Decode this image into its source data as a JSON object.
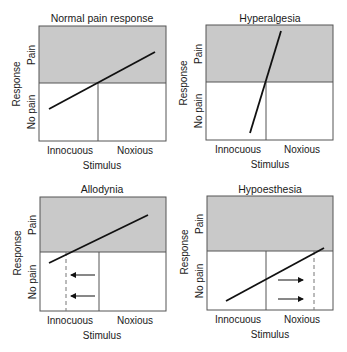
{
  "colors": {
    "pain_region": "#c9c9c9",
    "frame": "#555555",
    "curve": "#111111",
    "background": "#ffffff"
  },
  "axis": {
    "y_title": "Response",
    "y_pain": "Pain",
    "y_no_pain": "No pain",
    "x_title": "Stimulus",
    "x_innocuous": "Innocuous",
    "x_noxious": "Noxious"
  },
  "panels": [
    {
      "id": "normal",
      "title": "Normal pain response",
      "curve": {
        "x1": 49,
        "y1": 109,
        "x2": 155,
        "y2": 52
      },
      "dashed_line": null,
      "arrows": []
    },
    {
      "id": "hyperalgesia",
      "title": "Hyperalgesia",
      "curve": {
        "x1": 250,
        "y1": 133,
        "x2": 281,
        "y2": 31
      },
      "dashed_line": null,
      "arrows": []
    },
    {
      "id": "allodynia",
      "title": "Allodynia",
      "curve": {
        "x1": 49,
        "y1": 263,
        "x2": 148,
        "y2": 215
      },
      "dashed_line": {
        "x": 66
      },
      "arrows": [
        {
          "direction": "left",
          "from_x": 95,
          "to_x": 71,
          "y": 275
        },
        {
          "direction": "left",
          "from_x": 95,
          "to_x": 71,
          "y": 296
        }
      ]
    },
    {
      "id": "hypoesthesia",
      "title": "Hypoesthesia",
      "curve": {
        "x1": 226,
        "y1": 301,
        "x2": 324,
        "y2": 248
      },
      "dashed_line": {
        "x": 314
      },
      "arrows": [
        {
          "direction": "right",
          "from_x": 278,
          "to_x": 303,
          "y": 280
        },
        {
          "direction": "right",
          "from_x": 278,
          "to_x": 303,
          "y": 299
        }
      ]
    }
  ]
}
